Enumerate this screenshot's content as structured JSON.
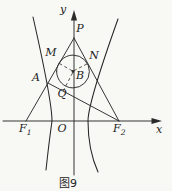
{
  "figure": {
    "caption": "图9",
    "colors": {
      "background": "#f8f8f5",
      "stroke": "#2b2b2b",
      "text": "#1c1c1c"
    },
    "labels": {
      "y_axis": "y",
      "x_axis": "x",
      "origin": "O",
      "P": "P",
      "M": "M",
      "N": "N",
      "A": "A",
      "B": "B",
      "Q": "Q",
      "F1_main": "F",
      "F1_sub": "1",
      "F2_main": "F",
      "F2_sub": "2"
    },
    "geometry": {
      "x_axis": "M 3 121 H 153",
      "x_axis_arrow": "M 162 121 L 151.5 117.9 L 151.5 124.1 Z",
      "y_axis": "M 74 175 V 14",
      "y_axis_arrow": "M 74 10 L 70.9 20.5 L 77.1 20.5 Z",
      "side_pf1": "M 26 121 L 74 38",
      "side_pf2": "M 74 38 L 119 121",
      "line_af2": "M 48 83 L 119 121",
      "incircle": "M 56.6 71.5 A 16.4 16.4 0 1 1 89.4 71.5 A 16.4 16.4 0 1 1 56.6 71.5",
      "center_dot": "M 73 71.5 m -1.4 0 a 1.4 1.4 0 1 0 2.8 0 a 1.4 1.4 0 1 0 -2.8 0 Z",
      "dash_bm": "M 72.2 70.8 L 59.2 63.4",
      "dash_bn": "M 73.8 70.7 L 87.3 63.8",
      "dash_bq": "M 72.6 72.9 L 63.2 90.9",
      "hyperbola_left_branch": "M 33 17 Q 52 101 52 121 Q 49 142 46 170",
      "hyperbola_right_branch": "M 118 19 Q 88 103 88 121 Q 88 150 98 172"
    }
  }
}
